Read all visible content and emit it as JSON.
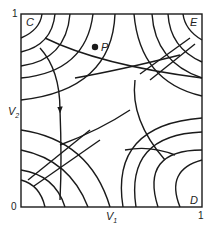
{
  "diagram": {
    "type": "phase-plane",
    "x_axis": {
      "label": "V",
      "label_sub": "1",
      "ticks": [
        "0",
        "1"
      ]
    },
    "y_axis": {
      "label": "V",
      "label_sub": "2",
      "ticks": [
        "0",
        "1"
      ]
    },
    "corners": {
      "top_left": "C",
      "top_right": "E",
      "bottom_right": "D"
    },
    "point": {
      "label": "P"
    },
    "colors": {
      "line": "#1a1a1a",
      "background": "#ffffff"
    }
  }
}
